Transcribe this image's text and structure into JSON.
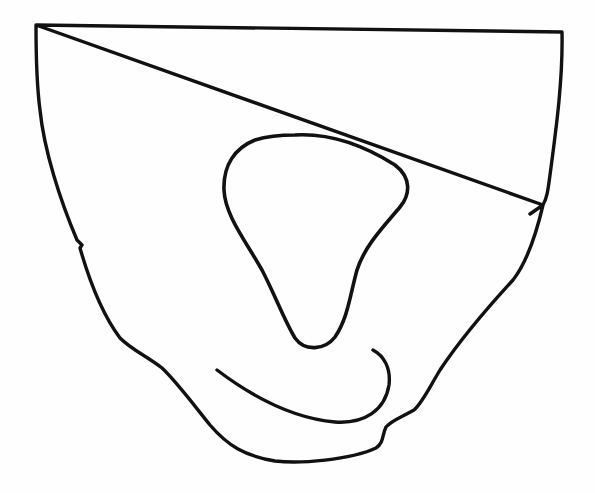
{
  "figure": {
    "stroke_color": "#111111",
    "background_color": "#fefefe",
    "stroke_width": 3.4,
    "shapes": [
      {
        "name": "outer-outline",
        "closed": true
      },
      {
        "name": "inner-loop",
        "closed": true
      },
      {
        "name": "lower-arc",
        "closed": false
      }
    ]
  }
}
